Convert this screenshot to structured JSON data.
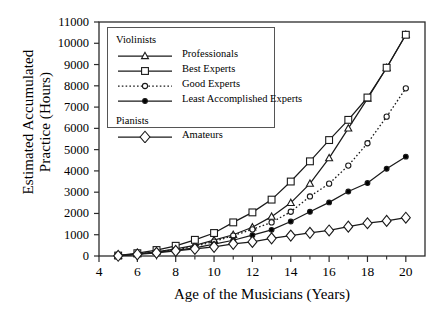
{
  "chart_data": {
    "type": "line",
    "title": "",
    "xlabel": "Age of the Musicians (Years)",
    "ylabel_line1": "Estimated Accumulated",
    "ylabel_line2": "Practice (Hours)",
    "ylabel": "Estimated Accumulated Practice (Hours)",
    "xlim": [
      4,
      21
    ],
    "ylim": [
      0,
      11000
    ],
    "xticks": [
      4,
      6,
      8,
      10,
      12,
      14,
      16,
      18,
      20
    ],
    "xtick_labels": [
      "4",
      "6",
      "8",
      "10",
      "12",
      "14",
      "16",
      "18",
      "20"
    ],
    "x_minor_ticks": [
      5,
      7,
      9,
      11,
      13,
      15,
      17,
      19
    ],
    "yticks": [
      0,
      1000,
      2000,
      3000,
      4000,
      5000,
      6000,
      7000,
      8000,
      9000,
      10000,
      11000
    ],
    "ytick_labels": [
      "0",
      "1000",
      "2000",
      "3000",
      "4000",
      "5000",
      "6000",
      "7000",
      "8000",
      "9000",
      "10000",
      "11000"
    ],
    "grid": false,
    "legend_position": "upper-left",
    "x": [
      5,
      6,
      7,
      8,
      9,
      10,
      11,
      12,
      13,
      14,
      15,
      16,
      17,
      18,
      19,
      20
    ],
    "series": [
      {
        "name": "Professionals",
        "group": "Violinists",
        "marker": "open-triangle",
        "linestyle": "solid",
        "values": [
          10,
          90,
          200,
          330,
          500,
          750,
          1000,
          1350,
          1850,
          2500,
          3400,
          4600,
          6000,
          7400,
          8850,
          10400
        ]
      },
      {
        "name": "Best Experts",
        "group": "Violinists",
        "marker": "open-square",
        "linestyle": "solid",
        "values": [
          20,
          130,
          280,
          480,
          760,
          1080,
          1580,
          2050,
          2650,
          3500,
          4450,
          5450,
          6400,
          7450,
          8850,
          10400
        ]
      },
      {
        "name": "Good Experts",
        "group": "Violinists",
        "marker": "open-circle",
        "linestyle": "dotted",
        "values": [
          15,
          100,
          200,
          300,
          450,
          680,
          960,
          1250,
          1580,
          2080,
          2800,
          3400,
          4250,
          5300,
          6550,
          7880
        ]
      },
      {
        "name": "Least Accomplished Experts",
        "group": "Violinists",
        "marker": "filled-circle",
        "linestyle": "solid",
        "values": [
          12,
          90,
          180,
          270,
          380,
          560,
          740,
          980,
          1230,
          1620,
          2080,
          2520,
          3030,
          3430,
          4100,
          4670
        ]
      },
      {
        "name": "Amateurs",
        "group": "Pianists",
        "marker": "open-diamond",
        "linestyle": "solid",
        "values": [
          10,
          80,
          150,
          240,
          330,
          430,
          570,
          660,
          830,
          960,
          1090,
          1200,
          1380,
          1540,
          1650,
          1800
        ]
      }
    ]
  },
  "legend": {
    "groups": [
      {
        "heading": "Violinists",
        "entries": [
          "Professionals",
          "Best Experts",
          "Good Experts",
          "Least Accomplished Experts"
        ]
      },
      {
        "heading": "Pianists",
        "entries": [
          "Amateurs"
        ]
      }
    ]
  },
  "colors": {
    "axis": "#2b2b2b",
    "line": "#1a1a1a",
    "marker_fill": "#ffffff",
    "marker_fill_solid": "#000000",
    "background": "#ffffff",
    "legend_border": "#555555"
  }
}
